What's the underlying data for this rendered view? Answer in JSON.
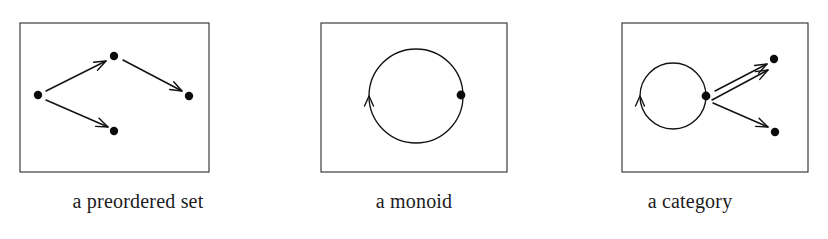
{
  "figure": {
    "background_color": "#ffffff",
    "ink_color": "#121212",
    "frame_color": "#2b2b2b",
    "panels": [
      {
        "id": "preordered-set",
        "caption": "a preordered set",
        "frame": {
          "x": 20,
          "y": 23,
          "width": 189,
          "height": 149
        },
        "nodes": [
          {
            "name": "node-left",
            "cx": 38,
            "cy": 95,
            "r": 4.2
          },
          {
            "name": "node-top",
            "cx": 114,
            "cy": 56,
            "r": 4.2
          },
          {
            "name": "node-bottom",
            "cx": 114,
            "cy": 131,
            "r": 4.2
          },
          {
            "name": "node-right",
            "cx": 189,
            "cy": 96,
            "r": 4.2
          }
        ],
        "arrows": [
          {
            "name": "arrow-left-to-top",
            "x1": 46,
            "y1": 91,
            "x2": 106,
            "y2": 61
          },
          {
            "name": "arrow-left-to-bottom",
            "x1": 46,
            "y1": 100,
            "x2": 108,
            "y2": 127
          },
          {
            "name": "arrow-top-to-right",
            "x1": 123,
            "y1": 60,
            "x2": 182,
            "y2": 91
          }
        ],
        "loops": []
      },
      {
        "id": "monoid",
        "caption": "a monoid",
        "frame": {
          "x": 45,
          "y": 23,
          "width": 186,
          "height": 149
        },
        "nodes": [
          {
            "name": "node-single",
            "cx": 185,
            "cy": 95,
            "r": 4.4
          }
        ],
        "arrows": [],
        "loops": [
          {
            "name": "loop-identity",
            "cx": 140,
            "cy": 96,
            "r": 47,
            "direction": "counterclockwise",
            "arrowhead_angle_deg": 180
          }
        ]
      },
      {
        "id": "category",
        "caption": "a category",
        "frame": {
          "x": 70,
          "y": 23,
          "width": 186,
          "height": 149
        },
        "nodes": [
          {
            "name": "node-loop-object",
            "cx": 154,
            "cy": 96,
            "r": 4.4
          },
          {
            "name": "node-upper-right",
            "cx": 222,
            "cy": 59,
            "r": 4.2
          },
          {
            "name": "node-lower-right",
            "cx": 223,
            "cy": 132,
            "r": 4.2
          }
        ],
        "arrows": [
          {
            "name": "arrow-object-to-upper",
            "x1": 163,
            "y1": 91,
            "x2": 215,
            "y2": 64
          },
          {
            "name": "arrow-object-to-upper-alt",
            "x1": 160,
            "y1": 100,
            "x2": 216,
            "y2": 70
          },
          {
            "name": "arrow-object-to-lower",
            "x1": 161,
            "y1": 103,
            "x2": 216,
            "y2": 127
          }
        ],
        "loops": [
          {
            "name": "loop-endomorphism",
            "cx": 121,
            "cy": 96,
            "r": 33,
            "direction": "counterclockwise",
            "arrowhead_angle_deg": 180
          }
        ]
      }
    ]
  }
}
